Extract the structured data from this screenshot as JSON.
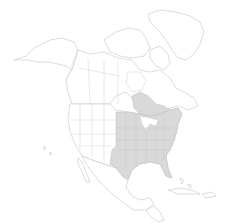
{
  "map": {
    "type": "distribution-range-map",
    "region": "North America",
    "colors": {
      "background": "#ffffff",
      "land_fill": "#ffffff",
      "outline": "#c4c4c4",
      "range_fill": "#d9d9d9"
    },
    "shaded_regions": [
      "Eastern United States",
      "Southern Ontario",
      "Southern Quebec"
    ]
  }
}
